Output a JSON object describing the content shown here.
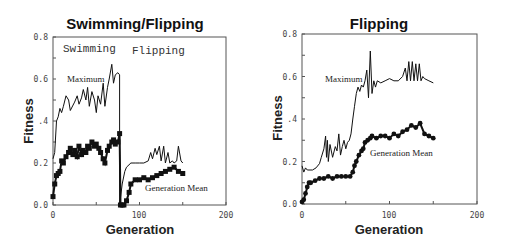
{
  "chart_data": [
    {
      "type": "line",
      "title": "Swimming/Flipping",
      "xlabel": "Generation",
      "ylabel": "Fitness",
      "xlim": [
        0,
        200
      ],
      "ylim": [
        0,
        0.8
      ],
      "xticks": [
        "0",
        "100",
        "200"
      ],
      "yticks": [
        "0.0",
        "0.2",
        "0.4",
        "0.6",
        "0.8"
      ],
      "grid": false,
      "annotations": [
        "Swimming",
        "Flipping"
      ],
      "series": [
        {
          "name": "Maximum",
          "style": "line",
          "x": [
            0,
            2,
            4,
            6,
            8,
            10,
            12,
            15,
            18,
            20,
            25,
            28,
            30,
            33,
            35,
            38,
            40,
            42,
            45,
            48,
            50,
            52,
            55,
            58,
            60,
            63,
            65,
            68,
            70,
            72,
            75,
            77,
            77,
            80,
            83,
            85,
            90,
            95,
            100,
            105,
            110,
            113,
            115,
            118,
            120,
            123,
            125,
            128,
            130,
            133,
            135,
            138,
            140,
            143,
            145,
            148,
            150
          ],
          "y": [
            0.22,
            0.25,
            0.4,
            0.42,
            0.46,
            0.44,
            0.47,
            0.52,
            0.5,
            0.45,
            0.49,
            0.52,
            0.48,
            0.51,
            0.55,
            0.5,
            0.56,
            0.47,
            0.54,
            0.5,
            0.44,
            0.52,
            0.48,
            0.58,
            0.47,
            0.56,
            0.6,
            0.67,
            0.58,
            0.62,
            0.63,
            0.62,
            0.0,
            0.1,
            0.16,
            0.18,
            0.2,
            0.2,
            0.2,
            0.2,
            0.21,
            0.25,
            0.22,
            0.27,
            0.24,
            0.28,
            0.21,
            0.28,
            0.2,
            0.25,
            0.2,
            0.21,
            0.2,
            0.21,
            0.28,
            0.21,
            0.2
          ]
        },
        {
          "name": "Generation Mean",
          "style": "square-markers",
          "x": [
            0,
            2,
            4,
            6,
            8,
            10,
            12,
            15,
            18,
            20,
            23,
            25,
            28,
            30,
            33,
            35,
            38,
            40,
            42,
            45,
            48,
            50,
            53,
            55,
            58,
            60,
            63,
            65,
            68,
            70,
            72,
            75,
            77,
            78,
            80,
            82,
            85,
            88,
            90,
            95,
            100,
            105,
            110,
            115,
            120,
            125,
            130,
            135,
            140,
            145,
            150
          ],
          "y": [
            0.04,
            0.1,
            0.14,
            0.15,
            0.16,
            0.21,
            0.2,
            0.23,
            0.25,
            0.27,
            0.24,
            0.26,
            0.23,
            0.28,
            0.24,
            0.26,
            0.25,
            0.28,
            0.27,
            0.3,
            0.28,
            0.29,
            0.27,
            0.25,
            0.22,
            0.2,
            0.26,
            0.28,
            0.3,
            0.31,
            0.29,
            0.3,
            0.34,
            0.0,
            0.0,
            0.0,
            0.02,
            0.06,
            0.1,
            0.12,
            0.12,
            0.13,
            0.12,
            0.13,
            0.14,
            0.15,
            0.16,
            0.17,
            0.18,
            0.16,
            0.15
          ]
        }
      ]
    },
    {
      "type": "line",
      "title": "Flipping",
      "xlabel": "Generation",
      "ylabel": "Fitness",
      "xlim": [
        0,
        200
      ],
      "ylim": [
        0,
        0.8
      ],
      "xticks": [
        "0",
        "100",
        "200"
      ],
      "yticks": [
        "0.0",
        "0.2",
        "0.4",
        "0.6",
        "0.8"
      ],
      "grid": false,
      "series": [
        {
          "name": "Maximum",
          "style": "line",
          "x": [
            0,
            2,
            4,
            6,
            8,
            12,
            16,
            20,
            22,
            25,
            27,
            28,
            29,
            30,
            32,
            35,
            38,
            40,
            42,
            44,
            46,
            48,
            50,
            52,
            54,
            56,
            58,
            60,
            62,
            64,
            66,
            68,
            70,
            72,
            74,
            76,
            78,
            80,
            82,
            84,
            86,
            90,
            95,
            100,
            105,
            110,
            115,
            118,
            120,
            122,
            124,
            126,
            128,
            130,
            132,
            134,
            136,
            138,
            140,
            145,
            150
          ],
          "y": [
            0.18,
            0.15,
            0.17,
            0.16,
            0.16,
            0.16,
            0.17,
            0.19,
            0.22,
            0.26,
            0.32,
            0.22,
            0.3,
            0.2,
            0.28,
            0.22,
            0.27,
            0.25,
            0.33,
            0.23,
            0.27,
            0.3,
            0.26,
            0.29,
            0.3,
            0.33,
            0.4,
            0.46,
            0.52,
            0.55,
            0.53,
            0.56,
            0.55,
            0.58,
            0.63,
            0.5,
            0.72,
            0.52,
            0.58,
            0.55,
            0.58,
            0.57,
            0.58,
            0.59,
            0.58,
            0.58,
            0.6,
            0.64,
            0.58,
            0.67,
            0.58,
            0.67,
            0.58,
            0.66,
            0.58,
            0.66,
            0.58,
            0.6,
            0.59,
            0.58,
            0.57
          ]
        },
        {
          "name": "Generation Mean",
          "style": "dot-markers",
          "x": [
            0,
            2,
            4,
            6,
            8,
            10,
            15,
            20,
            25,
            30,
            35,
            40,
            45,
            50,
            55,
            58,
            60,
            62,
            65,
            68,
            70,
            72,
            75,
            78,
            80,
            85,
            90,
            95,
            100,
            105,
            110,
            115,
            120,
            125,
            130,
            135,
            140,
            145,
            150
          ],
          "y": [
            0.01,
            0.02,
            0.05,
            0.08,
            0.1,
            0.1,
            0.11,
            0.12,
            0.12,
            0.13,
            0.12,
            0.13,
            0.13,
            0.13,
            0.13,
            0.15,
            0.18,
            0.2,
            0.23,
            0.25,
            0.26,
            0.29,
            0.3,
            0.31,
            0.32,
            0.31,
            0.32,
            0.32,
            0.31,
            0.33,
            0.32,
            0.34,
            0.35,
            0.37,
            0.36,
            0.38,
            0.33,
            0.32,
            0.31
          ]
        }
      ]
    }
  ],
  "left": {
    "title": "Swimming/Flipping",
    "ylabel": "Fitness",
    "xlabel": "Generation",
    "yticks": [
      "0.0",
      "0.2",
      ".4",
      "0.6",
      "0.8"
    ],
    "xticks": [
      "0",
      "100",
      "200"
    ],
    "phase_a": "Swimming",
    "phase_b": "Flipping",
    "label_max": "Maximum",
    "label_mean": "Generation Mean"
  },
  "right": {
    "title": "Flipping",
    "ylabel": "Fitness",
    "xlabel": "Generation",
    "yticks": [
      "0.0",
      "0.2",
      ".4",
      "0.6",
      "0.8"
    ],
    "xticks": [
      "0",
      "100",
      "200"
    ],
    "label_max": "Maximum",
    "label_mean": "Generation Mean"
  }
}
